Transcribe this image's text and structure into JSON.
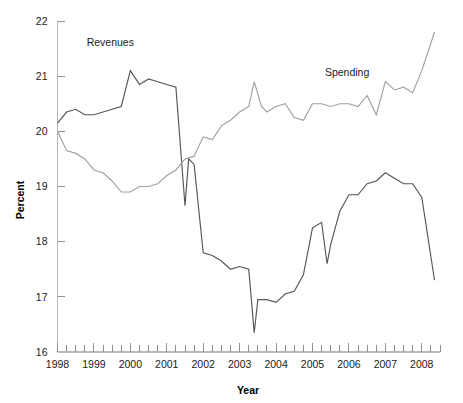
{
  "chart_data": {
    "type": "line",
    "title": "",
    "xlabel": "Year",
    "ylabel": "Percent",
    "xlim": [
      1998.0,
      2008.5
    ],
    "ylim": [
      16,
      22
    ],
    "grid": false,
    "legend_position": "inline-annotations",
    "y_ticks": [
      16,
      17,
      18,
      19,
      20,
      21,
      22
    ],
    "y_tick_labels": [
      "16",
      "17",
      "18",
      "19",
      "20",
      "21",
      "22"
    ],
    "x_ticks": [
      1998,
      1999,
      2000,
      2001,
      2002,
      2003,
      2004,
      2005,
      2006,
      2007,
      2008
    ],
    "x_tick_labels": [
      "1998",
      "1999",
      "2000",
      "2001",
      "2002",
      "2003",
      "2004",
      "2005",
      "2006",
      "2007",
      "2008"
    ],
    "x_minor_tick_interval": 0.25,
    "annotations": [
      {
        "text": "Revenues",
        "x": 1999.45,
        "y": 21.55
      },
      {
        "text": "Spending",
        "x": 2005.95,
        "y": 21.0
      }
    ],
    "series": [
      {
        "name": "Revenues",
        "color": "#555555",
        "x": [
          1998.0,
          1998.25,
          1998.5,
          1998.75,
          1999.0,
          1999.25,
          1999.5,
          1999.75,
          2000.0,
          2000.25,
          2000.5,
          2000.75,
          2001.0,
          2001.25,
          2001.5,
          2001.6,
          2001.75,
          2002.0,
          2002.25,
          2002.5,
          2002.75,
          2003.0,
          2003.25,
          2003.4,
          2003.5,
          2003.75,
          2004.0,
          2004.25,
          2004.5,
          2004.75,
          2005.0,
          2005.25,
          2005.4,
          2005.5,
          2005.75,
          2006.0,
          2006.25,
          2006.5,
          2006.75,
          2007.0,
          2007.25,
          2007.5,
          2007.75,
          2008.0,
          2008.35
        ],
        "values": [
          20.15,
          20.35,
          20.4,
          20.3,
          20.3,
          20.35,
          20.4,
          20.45,
          21.1,
          20.85,
          20.95,
          20.9,
          20.85,
          20.8,
          18.65,
          19.5,
          19.4,
          17.8,
          17.75,
          17.65,
          17.5,
          17.55,
          17.5,
          16.35,
          16.95,
          16.95,
          16.9,
          17.05,
          17.1,
          17.4,
          18.25,
          18.35,
          17.6,
          17.95,
          18.55,
          18.85,
          18.85,
          19.05,
          19.1,
          19.25,
          19.15,
          19.05,
          19.05,
          18.8,
          17.3
        ]
      },
      {
        "name": "Spending",
        "color": "#a0a0a0",
        "x": [
          1998.0,
          1998.25,
          1998.5,
          1998.75,
          1999.0,
          1999.25,
          1999.5,
          1999.75,
          2000.0,
          2000.25,
          2000.5,
          2000.75,
          2001.0,
          2001.25,
          2001.5,
          2001.75,
          2002.0,
          2002.25,
          2002.5,
          2002.75,
          2003.0,
          2003.25,
          2003.4,
          2003.6,
          2003.75,
          2004.0,
          2004.25,
          2004.5,
          2004.75,
          2005.0,
          2005.25,
          2005.5,
          2005.75,
          2006.0,
          2006.25,
          2006.5,
          2006.75,
          2007.0,
          2007.25,
          2007.5,
          2007.75,
          2008.0,
          2008.35
        ],
        "values": [
          20.0,
          19.65,
          19.6,
          19.5,
          19.3,
          19.25,
          19.1,
          18.9,
          18.9,
          19.0,
          19.0,
          19.05,
          19.2,
          19.3,
          19.5,
          19.55,
          19.9,
          19.85,
          20.1,
          20.2,
          20.35,
          20.45,
          20.9,
          20.45,
          20.35,
          20.45,
          20.5,
          20.25,
          20.2,
          20.5,
          20.5,
          20.45,
          20.5,
          20.5,
          20.45,
          20.65,
          20.3,
          20.9,
          20.75,
          20.8,
          20.7,
          21.1,
          21.8
        ]
      }
    ]
  }
}
